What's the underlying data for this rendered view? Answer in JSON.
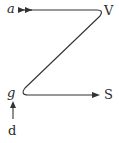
{
  "diagram": {
    "labels": {
      "a": "a",
      "v": "V",
      "g": "g",
      "s": "S",
      "d": "d"
    },
    "colors": {
      "stroke": "#333333",
      "text": "#2a2a2a",
      "background": "#ffffff"
    },
    "paths": {
      "z_path": "M 32 10 L 98 10 Q 104 10 100 16 L 25 88 Q 20 95 28 95 L 94 95",
      "input_arrow": "from a into top line (double arrowhead)",
      "output_arrow": "bottom line to S",
      "feed_arrow": "from d up toward g"
    }
  }
}
